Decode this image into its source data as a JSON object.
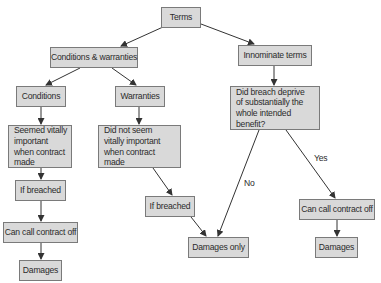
{
  "diagram": {
    "title": "Terms",
    "colors": {
      "box_fill": "#d9d9d9",
      "box_border": "#7a7a7a",
      "text": "#2b2b2b",
      "arrow": "#333333"
    },
    "nodes": {
      "terms": "Terms",
      "cw": "Conditions & warranties",
      "innominate": "Innominate terms",
      "conditions": "Conditions",
      "warranties": "Warranties",
      "seemed": "Seemed vitally important when contract made",
      "did_not_seem": "Did not seem vitally important when contract made",
      "did_breach": "Did breach deprive of substantially the whole intended benefit?",
      "if_breached_left": "If breached",
      "if_breached_mid": "If breached",
      "call_off_left": "Can call contract off",
      "call_off_right": "Can call contract off",
      "damages_left": "Damages",
      "damages_only": "Damages only",
      "damages_right": "Damages"
    },
    "edge_labels": {
      "no": "No",
      "yes": "Yes"
    }
  }
}
